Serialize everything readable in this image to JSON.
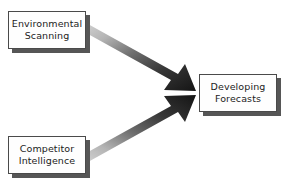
{
  "diagram": {
    "type": "flow-diagram",
    "title": "",
    "background_color": "#ffffff",
    "nodes": [
      {
        "id": "environmental-scanning",
        "label": "Environmental\nScanning",
        "shape": "rectangle",
        "fill_color": "#fefefe",
        "border_color": "#4a4a4a",
        "shadow_color": "#565656",
        "x": 8,
        "y": 11,
        "width": 78,
        "height": 38
      },
      {
        "id": "competitor-intelligence",
        "label": "Competitor\nIntelligence",
        "shape": "rectangle",
        "fill_color": "#fefefe",
        "border_color": "#4a4a4a",
        "shadow_color": "#565656",
        "x": 8,
        "y": 136,
        "width": 78,
        "height": 38
      },
      {
        "id": "developing-forecasts",
        "label": "Developing\nForecasts",
        "shape": "rectangle",
        "fill_color": "#fefefe",
        "border_color": "#4a4a4a",
        "shadow_color": "#565656",
        "x": 199,
        "y": 74,
        "width": 78,
        "height": 38
      }
    ],
    "edges": [
      {
        "id": "edge-scanning-to-forecasts",
        "from": "environmental-scanning",
        "to": "developing-forecasts",
        "style": "block-arrow-gradient",
        "direction": "down-right",
        "gradient_from": "#c9c9c9",
        "gradient_to": "#1a1a1a"
      },
      {
        "id": "edge-competitor-to-forecasts",
        "from": "competitor-intelligence",
        "to": "developing-forecasts",
        "style": "block-arrow-gradient",
        "direction": "up-right",
        "gradient_from": "#c9c9c9",
        "gradient_to": "#1a1a1a"
      }
    ]
  }
}
